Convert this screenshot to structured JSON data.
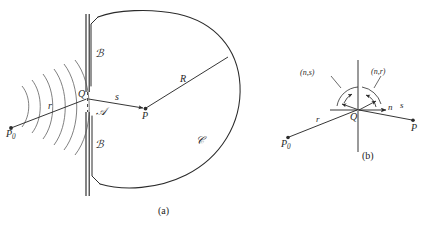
{
  "figure": {
    "panel_a": {
      "caption": "(a)",
      "labels": {
        "source_point": "P",
        "source_sub": "0",
        "incident_ray": "r",
        "aperture_point": "Q",
        "secondary_ray": "s",
        "field_point": "P",
        "radius": "R",
        "screen_upper": "ℬ",
        "aperture_region": "𝒜",
        "screen_lower": "ℬ",
        "sphere_surface": "𝒞"
      }
    },
    "panel_b": {
      "caption": "(b)",
      "labels": {
        "source_point": "P",
        "source_sub": "0",
        "incident_ray": "r",
        "vertex_point": "Q",
        "normal": "n",
        "secondary_ray": "s",
        "field_point": "P",
        "angle_ns": "(n,s)",
        "angle_nr": "(n,r)"
      }
    }
  },
  "style": {
    "ink": "#2b2b2b",
    "background": "#ffffff"
  }
}
